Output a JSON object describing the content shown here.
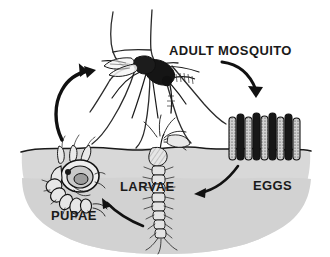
{
  "diagram": {
    "style": "hand-drawn ink illustration",
    "background_color": "#ffffff",
    "ink_color": "#1a1a1a",
    "water_color": "#d8d8d8",
    "water_shadow_color": "#cfcfcf"
  },
  "labels": {
    "adult": "ADULT MOSQUITO",
    "eggs": "EGGS",
    "larvae": "LARVAE",
    "pupae": "PUPAE"
  },
  "stages": [
    {
      "id": "adult",
      "label": "ADULT MOSQUITO",
      "location": "above water, biting a hand",
      "x": 200,
      "y": 50
    },
    {
      "id": "eggs",
      "label": "EGGS",
      "location": "water surface, right",
      "x": 266,
      "y": 185
    },
    {
      "id": "larvae",
      "label": "LARVAE",
      "location": "underwater, center",
      "x": 149,
      "y": 186
    },
    {
      "id": "pupae",
      "label": "PUPAE",
      "location": "underwater, left",
      "x": 74,
      "y": 215
    }
  ],
  "arrows": [
    {
      "id": "adult-to-eggs",
      "from": "adult",
      "to": "eggs",
      "direction": "down-right"
    },
    {
      "id": "eggs-to-larvae",
      "from": "eggs",
      "to": "larvae",
      "direction": "left"
    },
    {
      "id": "larvae-to-pupae",
      "from": "larvae",
      "to": "pupae",
      "direction": "up-left"
    },
    {
      "id": "pupae-to-adult",
      "from": "pupae",
      "to": "adult",
      "direction": "up-right"
    }
  ],
  "elements": {
    "hand": "hand and forearm outline being bitten",
    "water_surface": "wavy waterline across the scene",
    "water_body": "rounded gray pool of water"
  }
}
